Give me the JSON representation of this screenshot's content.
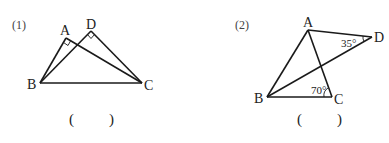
{
  "problems": [
    {
      "number": "(1)",
      "points": {
        "A": "A",
        "B": "B",
        "C": "C",
        "D": "D"
      },
      "right_angles": [
        "A",
        "D"
      ],
      "answer_blank": {
        "open": "(",
        "close": ")"
      }
    },
    {
      "number": "(2)",
      "points": {
        "A": "A",
        "B": "B",
        "C": "C",
        "D": "D"
      },
      "angles": {
        "D": "35°",
        "C": "70°"
      },
      "answer_blank": {
        "open": "(",
        "close": ")"
      }
    }
  ]
}
